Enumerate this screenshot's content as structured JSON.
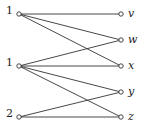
{
  "graph": {
    "type": "bipartite",
    "left_nodes": [
      {
        "id": "L1",
        "label": "1",
        "x": 19,
        "y": 14
      },
      {
        "id": "L2",
        "label": "1",
        "x": 19,
        "y": 66
      },
      {
        "id": "L3",
        "label": "2",
        "x": 19,
        "y": 117
      }
    ],
    "right_nodes": [
      {
        "id": "v",
        "label": "v",
        "x": 121,
        "y": 14
      },
      {
        "id": "w",
        "label": "w",
        "x": 121,
        "y": 40
      },
      {
        "id": "x",
        "label": "x",
        "x": 121,
        "y": 66
      },
      {
        "id": "y",
        "label": "y",
        "x": 121,
        "y": 92
      },
      {
        "id": "z",
        "label": "z",
        "x": 121,
        "y": 117
      }
    ],
    "edges": [
      [
        "L1",
        "v"
      ],
      [
        "L1",
        "w"
      ],
      [
        "L1",
        "x"
      ],
      [
        "L2",
        "w"
      ],
      [
        "L2",
        "x"
      ],
      [
        "L2",
        "y"
      ],
      [
        "L2",
        "z"
      ],
      [
        "L3",
        "y"
      ],
      [
        "L3",
        "z"
      ]
    ]
  }
}
